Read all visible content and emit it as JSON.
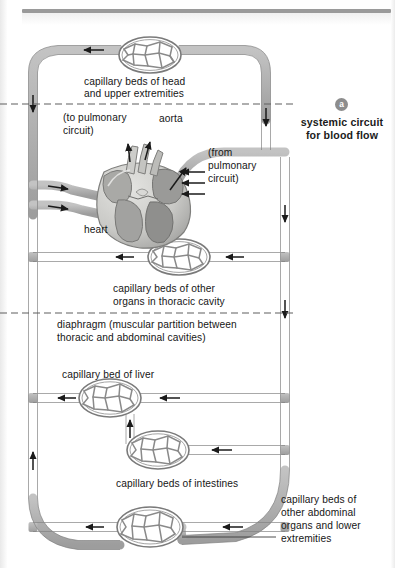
{
  "figure": {
    "panel_badge": "a",
    "panel_title_line1": "systemic circuit",
    "panel_title_line2": "for blood flow"
  },
  "labels": {
    "head_caps_line1": "capillary beds of head",
    "head_caps_line2": "and upper extremities",
    "to_pulmonary_line1": "(to pulmonary",
    "to_pulmonary_line2": "circuit)",
    "aorta": "aorta",
    "from_pulmonary_line1": "(from",
    "from_pulmonary_line2": "pulmonary",
    "from_pulmonary_line3": "circuit)",
    "heart": "heart",
    "thoracic_caps_line1": "capillary beds of other",
    "thoracic_caps_line2": "organs in thoracic cavity",
    "diaphragm_line1": "diaphragm (muscular partition between",
    "diaphragm_line2": "thoracic and abdominal cavities)",
    "liver_cap": "capillary bed of liver",
    "intestine_caps": "capillary beds of intestines",
    "abdominal_caps_line1": "capillary beds of",
    "abdominal_caps_line2": "other abdominal",
    "abdominal_caps_line3": "organs and lower",
    "abdominal_caps_line4": "extremities"
  },
  "colors": {
    "vessel_fill": "#b2b2b2",
    "vessel_stroke": "#6f6f6f",
    "capillary_stroke": "#7a7a7a",
    "dash_line": "#6e6e6e",
    "badge_bg": "#8d8d8d",
    "heart_light": "#d8d8d4",
    "heart_mid": "#a8a8a6",
    "heart_dark": "#848482",
    "text": "#161616",
    "top_rule": "#9a9a9a",
    "background": "#ffffff"
  },
  "diagram": {
    "type": "systemic-circulation-schematic",
    "dashed_divider_count": 2,
    "capillary_beds": [
      {
        "name": "head-and-upper-extremities",
        "cx": 150,
        "cy": 55,
        "rx": 30,
        "ry": 17
      },
      {
        "name": "thoracic-organs",
        "cx": 179,
        "cy": 257,
        "rx": 30,
        "ry": 17
      },
      {
        "name": "liver",
        "cx": 110,
        "cy": 398,
        "rx": 30,
        "ry": 18
      },
      {
        "name": "intestines",
        "cx": 158,
        "cy": 450,
        "rx": 30,
        "ry": 18
      },
      {
        "name": "other-abdominal-and-lower-extremities",
        "cx": 150,
        "cy": 527,
        "rx": 32,
        "ry": 19
      }
    ]
  }
}
